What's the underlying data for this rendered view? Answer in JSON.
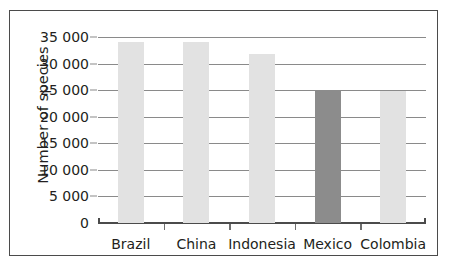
{
  "chart_data": {
    "type": "bar",
    "title": "",
    "subtitle": "",
    "xlabel": "",
    "ylabel": "Number of species",
    "categories": [
      "Brazil",
      "China",
      "Indonesia",
      "Mexico",
      "Colombia"
    ],
    "values": [
      34100,
      34000,
      31800,
      25000,
      24800
    ],
    "ylim": [
      0,
      35000
    ],
    "ytick_values": [
      0,
      5000,
      10000,
      15000,
      20000,
      25000,
      30000,
      35000
    ],
    "ytick_labels": [
      "0",
      "5 000",
      "10 000",
      "15 000",
      "20 000",
      "25 000",
      "30 000",
      "35 000"
    ],
    "grid": true,
    "legend": false,
    "bar_colors": [
      "#e2e2e2",
      "#e2e2e2",
      "#e2e2e2",
      "#8c8c8c",
      "#e2e2e2"
    ],
    "highlight_category": "Mexico",
    "colors": {
      "light_bar": "#e2e2e2",
      "dark_bar": "#8c8c8c",
      "gridline": "#8a8a8a",
      "axis": "#4b4b4b",
      "text": "#231f20",
      "background": "#ffffff"
    }
  }
}
